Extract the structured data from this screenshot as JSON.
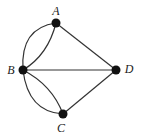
{
  "diagram": {
    "type": "multigraph",
    "nodes": [
      {
        "id": "A",
        "label": "A",
        "x": 56,
        "y": 23,
        "label_x": 56,
        "label_y": 15
      },
      {
        "id": "B",
        "label": "B",
        "x": 23,
        "y": 70,
        "label_x": 11,
        "label_y": 74
      },
      {
        "id": "C",
        "label": "C",
        "x": 63,
        "y": 114,
        "label_x": 61,
        "label_y": 132
      },
      {
        "id": "D",
        "label": "D",
        "x": 116,
        "y": 70,
        "label_x": 129,
        "label_y": 73
      }
    ],
    "edges": [
      {
        "from": "A",
        "to": "B",
        "curve": "outer"
      },
      {
        "from": "A",
        "to": "B",
        "curve": "inner"
      },
      {
        "from": "B",
        "to": "C",
        "curve": "outer"
      },
      {
        "from": "B",
        "to": "C",
        "curve": "inner"
      },
      {
        "from": "A",
        "to": "D",
        "curve": "straight"
      },
      {
        "from": "B",
        "to": "D",
        "curve": "straight"
      },
      {
        "from": "C",
        "to": "D",
        "curve": "straight"
      }
    ],
    "colors": {
      "edge": "#333333",
      "node": "#111111",
      "label": "#222222"
    }
  }
}
